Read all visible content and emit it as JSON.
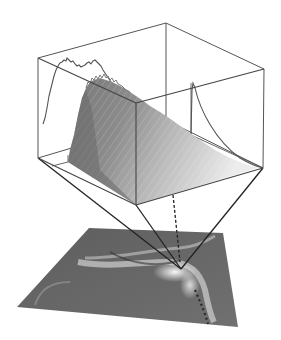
{
  "figure": {
    "colors": {
      "background": "#ffffff",
      "box_edge": "#444444",
      "projection_line": "#222222",
      "surface_light": "#e8e8e8",
      "surface_dark": "#6e6e6e",
      "plane": "#6b6b6b",
      "plane_highlight": "#f2f2f2"
    },
    "elements": {
      "box": "bounding-box",
      "surface": "surface-plot",
      "left_profile": "left-wall-profile-curve",
      "right_profile": "right-wall-decay-curve",
      "plane": "image-plane",
      "projection": "projection-lines",
      "dashed": "dashed-projection-line"
    }
  }
}
